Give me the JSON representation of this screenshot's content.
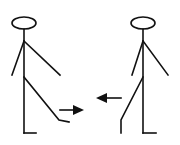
{
  "diagram": {
    "colors": {
      "stroke": "#111111",
      "background": "#ffffff"
    },
    "figures": [
      {
        "name": "left-figure",
        "kick_direction": "right"
      },
      {
        "name": "right-figure",
        "kick_direction": "left"
      }
    ],
    "arrows": [
      {
        "name": "right-arrow",
        "direction": "right"
      },
      {
        "name": "left-arrow",
        "direction": "left"
      }
    ]
  }
}
